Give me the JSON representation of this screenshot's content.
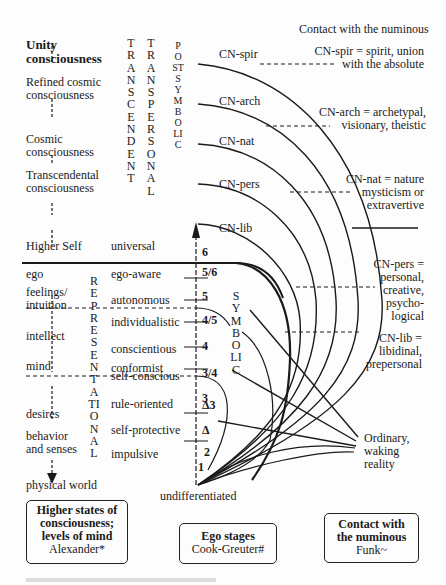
{
  "header": {
    "title": "Contact with the numinous"
  },
  "left_column": {
    "title": "Unity consciousness",
    "levels": [
      "Refined cosmic consciousness",
      "Cosmic consciousness",
      "Transcendental consciousness",
      "Higher Self",
      "ego",
      "feelings/ intuition",
      "intellect",
      "mind",
      "desires",
      "behavior and senses",
      "physical world"
    ]
  },
  "vertical_labels": {
    "transcendent": "TRANSCENDENT",
    "transpersonal": "TRANSPERSONAL",
    "postsymbolic": "POSTSYMBOLIC",
    "representational": "REPRESENTATIONAL",
    "symbolic": "SYMBOLIC"
  },
  "ego_stages": [
    "universal",
    "ego-aware",
    "autonomous",
    "individualistic",
    "conscientious",
    "self-conscious",
    "conformist",
    "rule-oriented",
    "self-protective",
    "impulsive"
  ],
  "axis": {
    "numbers": [
      "6",
      "5/6",
      "5",
      "4/5",
      "4",
      "3/4",
      "3",
      "Δ3",
      "Δ",
      "2",
      "1"
    ],
    "bottom_label": "undifferentiated"
  },
  "cn_arcs": [
    "CN-spir",
    "CN-arch",
    "CN-nat",
    "CN-pers",
    "CN-lib"
  ],
  "cn_definitions": [
    {
      "line1": "CN-spir = spirit, union",
      "line2": "with the absolute"
    },
    {
      "line1": "CN-arch = archetypal,",
      "line2": "visionary, theistic"
    },
    {
      "line1": "CN-nat = nature",
      "line2": "mysticism or",
      "line3": "extravertive"
    },
    {
      "line1": "CN-pers =",
      "line2": "personal,",
      "line3": "creative,",
      "line4": "psycho-",
      "line5": "logical"
    },
    {
      "line1": "CN-lib =",
      "line2": "libidinal,",
      "line3": "prepersonal"
    }
  ],
  "ordinary": {
    "line1": "Ordinary,",
    "line2": "waking",
    "line3": "reality"
  },
  "legend_boxes": [
    {
      "title1": "Higher states of",
      "title2": "consciousness;",
      "title3": "levels of mind",
      "author": "Alexander*"
    },
    {
      "title1": "Ego stages",
      "author": "Cook-Greuter#"
    },
    {
      "title1": "Contact with",
      "title2": "the numinous",
      "author": "Funk~"
    }
  ]
}
